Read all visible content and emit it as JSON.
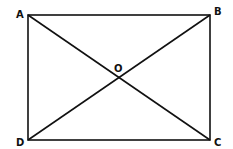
{
  "diagram": {
    "type": "geometry",
    "shape": "rectangle",
    "points": {
      "A": {
        "label": "A",
        "x": 28,
        "y": 15
      },
      "B": {
        "label": "B",
        "x": 210,
        "y": 15
      },
      "C": {
        "label": "C",
        "x": 210,
        "y": 140
      },
      "D": {
        "label": "D",
        "x": 28,
        "y": 140
      },
      "O": {
        "label": "O",
        "x": 119,
        "y": 77.5
      }
    },
    "segments": [
      [
        "A",
        "B"
      ],
      [
        "B",
        "C"
      ],
      [
        "C",
        "D"
      ],
      [
        "D",
        "A"
      ],
      [
        "A",
        "C"
      ],
      [
        "B",
        "D"
      ]
    ],
    "colors": {
      "stroke": "#111111",
      "background": "#ffffff"
    }
  }
}
